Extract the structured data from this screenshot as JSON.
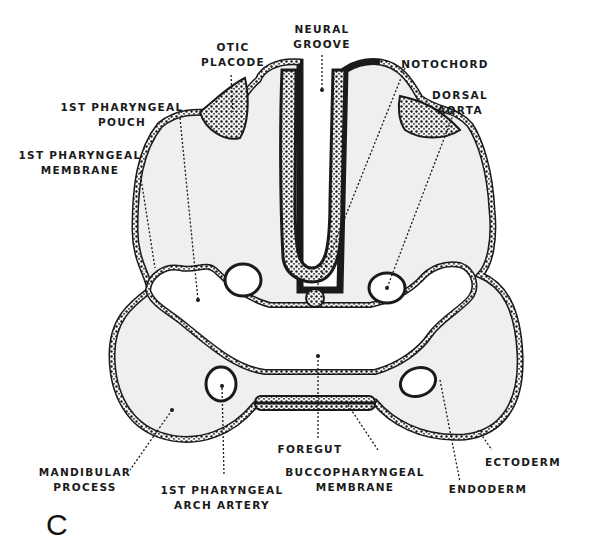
{
  "figure": {
    "panel_letter": "C",
    "colors": {
      "outline": "#1a1a1a",
      "tissue": "#efefef",
      "background": "#ffffff",
      "cavity": "#ffffff"
    },
    "labels": {
      "otic_placode": [
        "OTIC",
        "PLACODE"
      ],
      "neural_groove": [
        "NEURAL",
        "GROOVE"
      ],
      "notochord": [
        "NOTOCHORD"
      ],
      "dorsal_aorta": [
        "DORSAL",
        "AORTA"
      ],
      "pharyngeal_pouch": [
        "1ST PHARYNGEAL",
        "POUCH"
      ],
      "pharyngeal_membrane": [
        "1ST PHARYNGEAL",
        "MEMBRANE"
      ],
      "mandibular_process": [
        "MANDIBULAR",
        "PROCESS"
      ],
      "arch_artery": [
        "1ST PHARYNGEAL",
        "ARCH ARTERY"
      ],
      "foregut": [
        "FOREGUT"
      ],
      "buccopharyngeal_membrane": [
        "BUCCOPHARYNGEAL",
        "MEMBRANE"
      ],
      "ectoderm": [
        "ECTODERM"
      ],
      "endoderm": [
        "ENDODERM"
      ]
    }
  }
}
